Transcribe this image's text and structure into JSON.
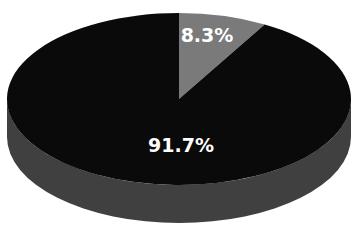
{
  "chart_data": {
    "type": "pie",
    "style": "3d",
    "title": "",
    "categories": [
      "Segment A",
      "Segment B"
    ],
    "values": [
      8.3,
      91.7
    ],
    "labels": [
      "8.3%",
      "91.7%"
    ],
    "colors": [
      "#7a7a7a",
      "#0a0a0a"
    ],
    "side_color": "#404040",
    "legend": "none",
    "start_angle_deg": 0,
    "direction": "clockwise"
  }
}
